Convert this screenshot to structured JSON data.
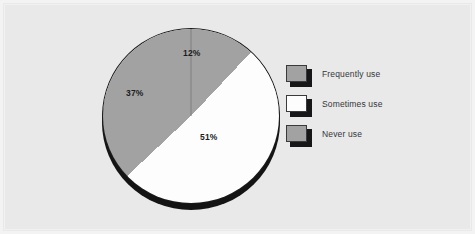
{
  "figure": {
    "background_color": "#e9e9e9",
    "frame_color": "#f3f3f3"
  },
  "chart_data": {
    "type": "pie",
    "title": "",
    "subtitle": "",
    "xlabel": "",
    "ylabel": "",
    "grid": false,
    "legend_position": "right",
    "start_angle_deg": 0,
    "direction": "clockwise",
    "categories": [
      "Frequently use",
      "Sometimes use",
      "Never use"
    ],
    "values": [
      12,
      51,
      37
    ],
    "unit": "%",
    "data_labels": [
      "12%",
      "51%",
      "37%"
    ],
    "slice_colors": [
      "#a2a2a2",
      "#fdfdfd",
      "#a2a2a2"
    ],
    "slice_edge_color": "#1b1b1b",
    "depth_shadow_color": "#141414",
    "slices": [
      {
        "label": "Frequently use",
        "value": 12,
        "data_label": "12%",
        "color": "#a2a2a2"
      },
      {
        "label": "Sometimes use",
        "value": 51,
        "data_label": "51%",
        "color": "#fdfdfd"
      },
      {
        "label": "Never use",
        "value": 37,
        "data_label": "37%",
        "color": "#a2a2a2"
      }
    ]
  },
  "legend": {
    "items": [
      {
        "label": "Frequently use",
        "color": "#a2a2a2",
        "swatch_name": "legend-swatch-frequently-use"
      },
      {
        "label": "Sometimes use",
        "color": "#fdfdfd",
        "swatch_name": "legend-swatch-sometimes-use"
      },
      {
        "label": "Never use",
        "color": "#a2a2a2",
        "swatch_name": "legend-swatch-never-use"
      }
    ]
  }
}
